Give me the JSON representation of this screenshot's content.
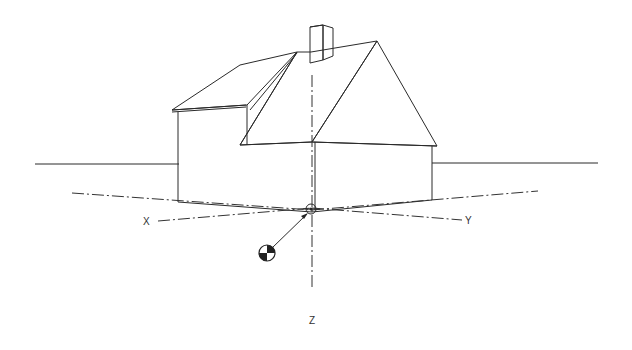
{
  "diagram": {
    "axes": [
      {
        "id": "x",
        "label": "X"
      },
      {
        "id": "y",
        "label": "Y"
      },
      {
        "id": "z",
        "label": "Z"
      }
    ],
    "symbols": {
      "center_of_gravity": "cg-symbol",
      "origin": "origin-circle"
    },
    "colors": {
      "line": "#2a2a2a",
      "background": "#ffffff"
    }
  }
}
